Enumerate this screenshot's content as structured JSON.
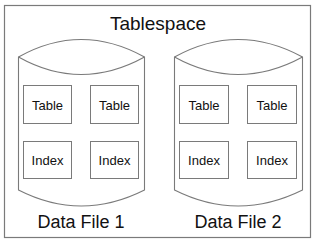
{
  "diagram": {
    "title": "Tablespace",
    "data_files": [
      {
        "label": "Data File 1",
        "segments": [
          {
            "label": "Table"
          },
          {
            "label": "Table"
          },
          {
            "label": "Index"
          },
          {
            "label": "Index"
          }
        ]
      },
      {
        "label": "Data File 2",
        "segments": [
          {
            "label": "Table"
          },
          {
            "label": "Table"
          },
          {
            "label": "Index"
          },
          {
            "label": "Index"
          }
        ]
      }
    ]
  },
  "colors": {
    "stroke": "#7a7a7a",
    "text": "#111111",
    "background": "#ffffff"
  }
}
